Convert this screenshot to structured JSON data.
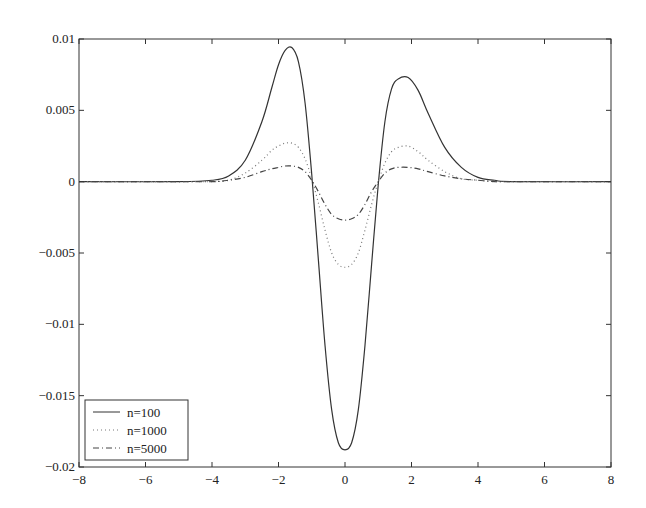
{
  "chart_data": {
    "type": "line",
    "title": "",
    "xlabel": "",
    "ylabel": "",
    "xlim": [
      -8,
      8
    ],
    "ylim": [
      -0.02,
      0.01
    ],
    "grid": false,
    "legend_position": "lower left",
    "x_ticks": [
      "-8",
      "-6",
      "-4",
      "-2",
      "0",
      "2",
      "4",
      "6",
      "8"
    ],
    "y_ticks": [
      "0.01",
      "0.005",
      "0",
      "-0.005",
      "-0.01",
      "-0.015",
      "-0.02"
    ],
    "x": [
      -8,
      -5,
      -4,
      -3.5,
      -3,
      -2.5,
      -2.2,
      -2,
      -1.8,
      -1.6,
      -1.4,
      -1.2,
      -1,
      -0.8,
      -0.6,
      -0.4,
      -0.2,
      0,
      0.2,
      0.4,
      0.6,
      0.8,
      1,
      1.2,
      1.4,
      1.6,
      1.9,
      2.2,
      2.5,
      3,
      3.5,
      4,
      4.5,
      5,
      8
    ],
    "series": [
      {
        "name": "n=100",
        "style": "solid",
        "values": [
          0,
          0,
          0.0001,
          0.0004,
          0.0015,
          0.0042,
          0.0066,
          0.0082,
          0.0092,
          0.0094,
          0.0084,
          0.0055,
          0.0005,
          -0.0055,
          -0.0115,
          -0.016,
          -0.0183,
          -0.0188,
          -0.0183,
          -0.016,
          -0.0115,
          -0.0058,
          -0.0002,
          0.0042,
          0.0065,
          0.0072,
          0.0073,
          0.0064,
          0.0048,
          0.0024,
          0.001,
          0.0003,
          0.0001,
          0,
          0
        ]
      },
      {
        "name": "n=1000",
        "style": "dotted",
        "values": [
          0,
          0,
          0,
          0.0001,
          0.0006,
          0.0015,
          0.0022,
          0.0025,
          0.0027,
          0.0027,
          0.0024,
          0.0016,
          0.0002,
          -0.0015,
          -0.0034,
          -0.005,
          -0.0058,
          -0.006,
          -0.0058,
          -0.005,
          -0.0034,
          -0.0016,
          0,
          0.0013,
          0.0021,
          0.0024,
          0.0025,
          0.0021,
          0.0015,
          0.0007,
          0.0002,
          0.0001,
          0,
          0,
          0
        ]
      },
      {
        "name": "n=5000",
        "style": "dashdot",
        "values": [
          0,
          0,
          0,
          0.0001,
          0.0003,
          0.0007,
          0.0009,
          0.001,
          0.0011,
          0.0011,
          0.001,
          0.0007,
          0.0001,
          -0.0007,
          -0.0016,
          -0.0023,
          -0.0026,
          -0.0027,
          -0.0026,
          -0.0023,
          -0.0016,
          -0.0007,
          0,
          0.0006,
          0.0009,
          0.001,
          0.001,
          0.0009,
          0.0007,
          0.0004,
          0.0002,
          0.0001,
          0,
          0,
          0
        ]
      }
    ]
  },
  "legend": {
    "items": [
      "n=100",
      "n=1000",
      "n=5000"
    ]
  }
}
